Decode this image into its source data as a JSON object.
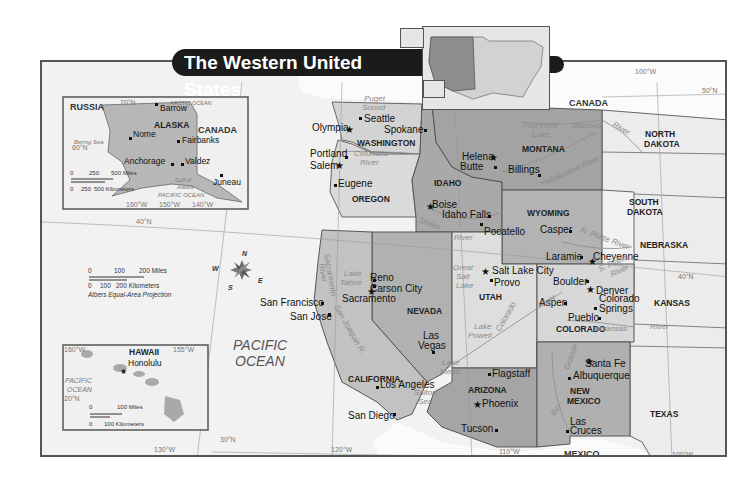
{
  "title": "The Western United States",
  "colors": {
    "ocean": "#f4f4f4",
    "foreign_land": "#fbfbfb",
    "west_state_light": "#d6d6d6",
    "west_state_mid": "#b9b9b9",
    "west_state_dark": "#a3a3a3",
    "other_states": "#ececec",
    "banner": "#1b1b1b"
  },
  "countries": [
    "CANADA",
    "MEXICO",
    "RUSSIA"
  ],
  "states": [
    {
      "name": "WASHINGTON"
    },
    {
      "name": "OREGON"
    },
    {
      "name": "IDAHO"
    },
    {
      "name": "MONTANA"
    },
    {
      "name": "WYOMING"
    },
    {
      "name": "NEVADA"
    },
    {
      "name": "UTAH"
    },
    {
      "name": "COLORADO"
    },
    {
      "name": "CALIFORNIA"
    },
    {
      "name": "ARIZONA"
    },
    {
      "name": "NEW",
      "line2": "MEXICO"
    },
    {
      "name": "NORTH",
      "line2": "DAKOTA"
    },
    {
      "name": "SOUTH",
      "line2": "DAKOTA"
    },
    {
      "name": "NEBRASKA"
    },
    {
      "name": "KANSAS"
    },
    {
      "name": "TEXAS"
    }
  ],
  "cities": {
    "seattle": "Seattle",
    "olympia": "Olympia",
    "spokane": "Spokane",
    "portland": "Portland",
    "salem": "Salem",
    "eugene": "Eugene",
    "helena": "Helena",
    "butte": "Butte",
    "billings": "Billings",
    "boise": "Boise",
    "idaho_falls": "Idaho Falls",
    "pocatello": "Pocatello",
    "casper": "Casper",
    "laramie": "Laramie",
    "cheyenne": "Cheyenne",
    "salt_lake_city": "Salt Lake City",
    "provo": "Provo",
    "boulder": "Boulder",
    "denver": "Denver",
    "aspen": "Aspen",
    "colorado_springs_1": "Colorado",
    "colorado_springs_2": "Springs",
    "pueblo": "Pueblo",
    "reno": "Reno",
    "carson_city": "Carson City",
    "sacramento": "Sacramento",
    "san_francisco": "San Francisco",
    "san_jose": "San Jose",
    "las_vegas_1": "Las",
    "las_vegas_2": "Vegas",
    "los_angeles": "Los Angeles",
    "san_diego": "San Diego",
    "flagstaff": "Flagstaff",
    "phoenix": "Phoenix",
    "tucson": "Tucson",
    "santa_fe": "Santa Fe",
    "albuquerque": "Albuquerque",
    "las_cruces_1": "Las",
    "las_cruces_2": "Cruces"
  },
  "water": {
    "puget_1": "Puget",
    "puget_2": "Sound",
    "columbia_1": "Columbia",
    "columbia_2": "River",
    "fort_peck_1": "Fort Peck",
    "fort_peck_2": "Lake",
    "missouri": "Missouri",
    "missouri_river": "River",
    "yellowstone": "Yellowstone River",
    "snake": "Snake",
    "snake_river": "River",
    "n_platte": "N. Platte River",
    "s_platte_1": "S. Platte",
    "s_platte_2": "River",
    "gsl_1": "Great",
    "gsl_2": "Salt",
    "gsl_3": "Lake",
    "tahoe_1": "Lake",
    "tahoe_2": "Tahoe",
    "sacramento_river_1": "Sacramento",
    "sacramento_river_2": "River",
    "san_joaquin": "San Joaquin R.",
    "colorado_river": "Colorado",
    "colorado_river_2": "River",
    "lake_powell_1": "Lake",
    "lake_powell_2": "Powell",
    "lake_mead_1": "Lake",
    "lake_mead_2": "Mead",
    "arkansas": "Arkansas",
    "arkansas_river": "River",
    "salton_1": "Salton",
    "salton_2": "Sea",
    "rio_grande_1": "Rio",
    "rio_grande_2": "Grande",
    "pacific_1": "PACIFIC",
    "pacific_2": "OCEAN"
  },
  "graticule": {
    "lat_50": "50°N",
    "lat_40_left": "40°N",
    "lat_40_right": "40°N",
    "lat_30": "30°N",
    "lon_130": "130°W",
    "lon_120": "120°W",
    "lon_110": "110°W",
    "lon_100_top": "100°W",
    "lon_100_bottom": "100°W"
  },
  "compass": {
    "n": "N",
    "s": "S",
    "e": "E",
    "w": "W"
  },
  "scale": {
    "miles_0": "0",
    "miles_100": "100",
    "miles_200": "200 Miles",
    "km_0": "0",
    "km_100": "100",
    "km_200": "200 Kilometers",
    "projection": "Albers Equal-Area Projection"
  },
  "alaska_inset": {
    "state": "ALASKA",
    "russia": "RUSSIA",
    "canada": "CANADA",
    "arctic": "ARCTIC OCEAN",
    "bering": "Bering Sea",
    "gulf_1": "Gulf of",
    "gulf_2": "Alaska",
    "pacific": "PACIFIC OCEAN",
    "lat_70": "70°N",
    "lat_60": "60°N",
    "lon_160": "160°W",
    "lon_150": "150°W",
    "lon_140": "140°W",
    "cities": {
      "barrow": "Barrow",
      "nome": "Nome",
      "fairbanks": "Fairbanks",
      "anchorage": "Anchorage",
      "valdez": "Valdez",
      "juneau": "Juneau"
    },
    "scale_miles": {
      "a": "0",
      "b": "250",
      "c": "500 Miles"
    },
    "scale_km": {
      "a": "0",
      "b": "250",
      "c": "500 Kilometers"
    }
  },
  "hawaii_inset": {
    "state": "HAWAII",
    "capital": "Honolulu",
    "pacific_1": "PACIFIC",
    "pacific_2": "OCEAN",
    "lon_160": "160°W",
    "lon_155": "155°W",
    "lat_20": "20°N",
    "scale_miles": {
      "a": "0",
      "b": "100 Miles"
    },
    "scale_km": {
      "a": "0",
      "b": "100 Kilometers"
    }
  }
}
